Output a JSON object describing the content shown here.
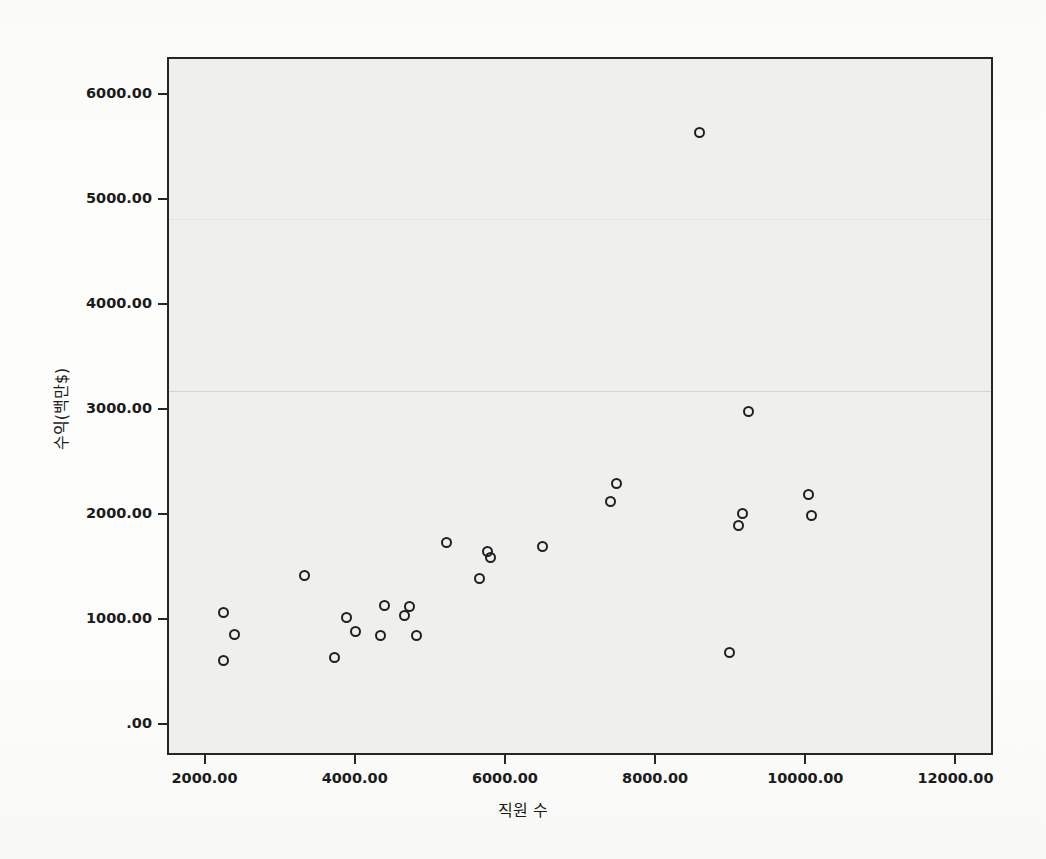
{
  "chart_data": {
    "type": "scatter",
    "title": "",
    "xlabel": "직원 수",
    "ylabel": "수익(백만$)",
    "xlim": [
      1500,
      12500
    ],
    "ylim": [
      -300,
      6350
    ],
    "grid": false,
    "legend": false,
    "marker": "open-circle",
    "marker_color": "#1f1f1f",
    "plot_background": "#efefee",
    "frame_color": "#262626",
    "x_ticks": [
      "2000.00",
      "4000.00",
      "6000.00",
      "8000.00",
      "10000.00",
      "12000.00"
    ],
    "x_tick_values": [
      2000,
      4000,
      6000,
      8000,
      10000,
      12000
    ],
    "y_ticks": [
      ".00",
      "1000.00",
      "2000.00",
      "3000.00",
      "4000.00",
      "5000.00",
      "6000.00"
    ],
    "y_tick_values": [
      0,
      1000,
      2000,
      3000,
      4000,
      5000,
      6000
    ],
    "series": [
      {
        "name": "기업",
        "points": [
          [
            2230,
            615
          ],
          [
            2220,
            1080
          ],
          [
            2370,
            870
          ],
          [
            3310,
            1430
          ],
          [
            3710,
            650
          ],
          [
            3870,
            1030
          ],
          [
            3990,
            900
          ],
          [
            4310,
            860
          ],
          [
            4370,
            1140
          ],
          [
            4640,
            1050
          ],
          [
            4700,
            1130
          ],
          [
            4790,
            860
          ],
          [
            5190,
            1740
          ],
          [
            5640,
            1400
          ],
          [
            5740,
            1660
          ],
          [
            5780,
            1600
          ],
          [
            6470,
            1710
          ],
          [
            7380,
            2130
          ],
          [
            7460,
            2310
          ],
          [
            8560,
            5650
          ],
          [
            8970,
            700
          ],
          [
            9090,
            1910
          ],
          [
            9140,
            2020
          ],
          [
            9220,
            2990
          ],
          [
            10020,
            2200
          ],
          [
            10050,
            2000
          ]
        ]
      }
    ]
  },
  "bleed_text": {
    "lines": [
      "연구에서는 다음과 같은 자료를 사용하였다",
      "표본 기업수",
      "자료 수집 기간",
      "분석 방법",
      "회귀분석",
      "상관분석",
      "기술통계",
      "변수 설명",
      "독립변수",
      "종속변수",
      "직원 수와 수익 사이에는 양의 상관관계가 있는 것으로 나타났다",
      "다음 절에서는 회귀분석 결과를 제시한다"
    ]
  }
}
